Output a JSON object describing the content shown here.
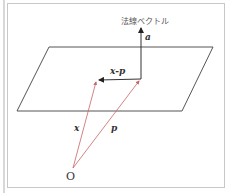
{
  "diagram": {
    "labels": {
      "normal_vector": "法線ベクトル",
      "a": "a",
      "x_minus_p": "x-p",
      "x": "x",
      "p": "p",
      "origin": "O"
    },
    "colors": {
      "plane": "#555555",
      "normal": "#333333",
      "position_vectors": "#c86464",
      "frame": "#c8c8c8"
    },
    "geometry": {
      "plane": [
        [
          49,
          47
        ],
        [
          213,
          47
        ],
        [
          182,
          111
        ],
        [
          17,
          111
        ]
      ],
      "origin": [
        73,
        168
      ],
      "x_tip": [
        97,
        80
      ],
      "p_tip": [
        141,
        79
      ],
      "normal_tip": [
        141,
        26
      ]
    }
  }
}
